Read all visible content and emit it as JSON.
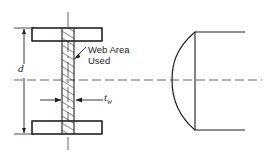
{
  "figure": {
    "kind": "engineering-cross-section-diagram",
    "annotations": {
      "web_area_line1": "Web Area",
      "web_area_line2": "Used",
      "depth_symbol": "d",
      "web_thickness_symbol": "t",
      "web_thickness_subscript": "w"
    },
    "colors": {
      "line": "#231f20",
      "hatch": "#231f20",
      "centerline": "#4d4d4d",
      "background": "#ffffff"
    },
    "left_view": {
      "name": "I-beam cross section",
      "top_flange": {
        "x": 32,
        "y": 28,
        "width": 70,
        "height": 13
      },
      "bottom_flange": {
        "x": 32,
        "y": 121,
        "width": 70,
        "height": 13
      },
      "web": {
        "x": 62,
        "y": 41,
        "width": 12,
        "height": 80
      },
      "vertical_centerline_x": 68,
      "horizontal_centerline_y": 80,
      "depth_dimension_line_x": 24,
      "depth_arrow_top_y": 28,
      "depth_arrow_bottom_y": 134
    },
    "right_view": {
      "name": "Shear stress distribution",
      "vertical_edge_x": 195,
      "top_y": 32,
      "bottom_y": 130,
      "curve_apex_x": 172,
      "flange_line_right_x": 245,
      "centerline_y": 80
    }
  }
}
